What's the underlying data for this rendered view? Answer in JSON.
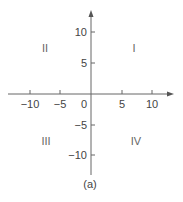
{
  "diagram": {
    "type": "cartesian-plane",
    "caption": "(a)",
    "x_axis": {
      "ticks": [
        {
          "value": -10,
          "label": "−10"
        },
        {
          "value": -5,
          "label": "−5"
        },
        {
          "value": 0,
          "label": "0"
        },
        {
          "value": 5,
          "label": "5"
        },
        {
          "value": 10,
          "label": "10"
        }
      ]
    },
    "y_axis": {
      "ticks": [
        {
          "value": 10,
          "label": "10"
        },
        {
          "value": 5,
          "label": "5"
        },
        {
          "value": -5,
          "label": "−5"
        },
        {
          "value": -10,
          "label": "−10"
        }
      ]
    },
    "quadrants": [
      {
        "name": "I",
        "label": "I"
      },
      {
        "name": "II",
        "label": "II"
      },
      {
        "name": "III",
        "label": "III"
      },
      {
        "name": "IV",
        "label": "IV"
      }
    ],
    "colors": {
      "axis": "#666666",
      "text": "#444444"
    }
  }
}
